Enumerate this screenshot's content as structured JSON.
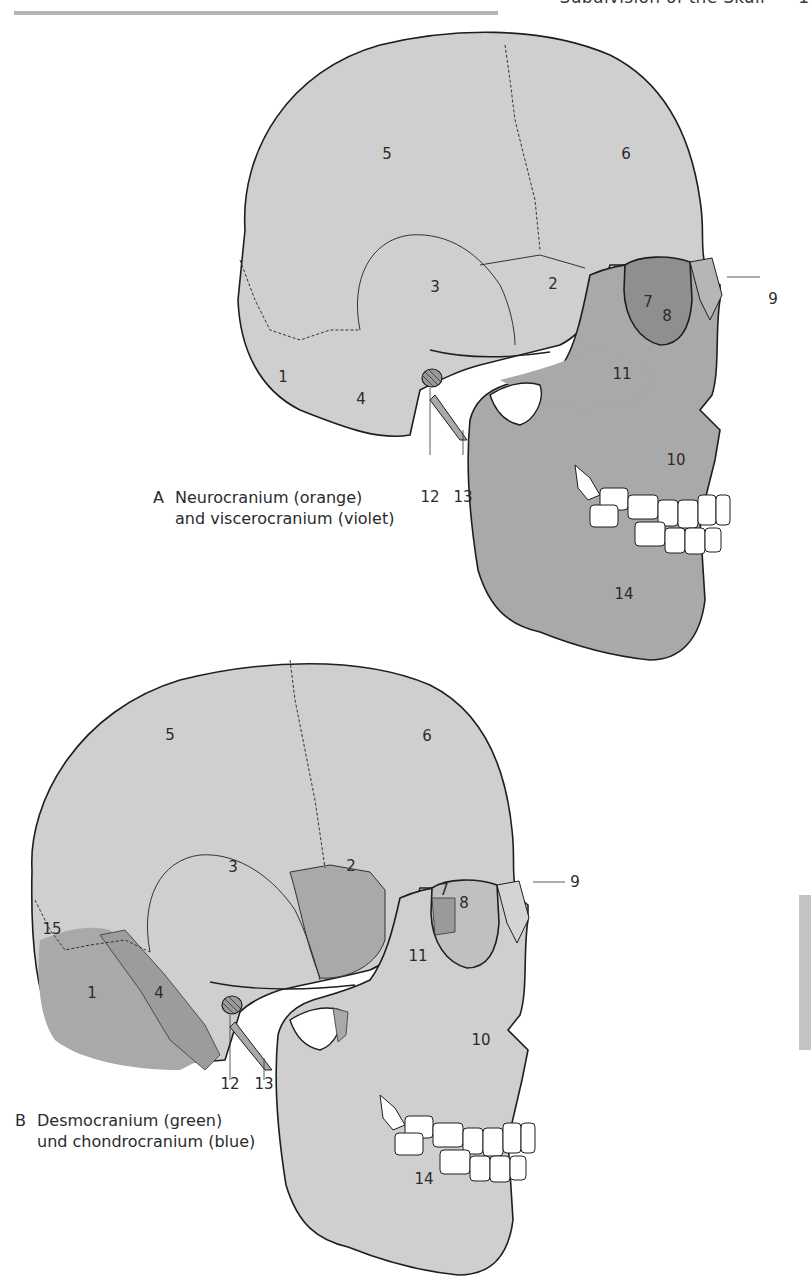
{
  "header": {
    "title": "Subdivision of the Skull",
    "page_number": "1"
  },
  "colors": {
    "light_bone": "#cfcfcf",
    "dark_bone": "#a9a9a9",
    "orbit_shadow": "#8f8f8f",
    "outline": "#1e1e1e",
    "teeth": "#ffffff",
    "header_rule": "#b4b4b4",
    "side_tab": "#c4c4c4"
  },
  "figures": [
    {
      "id": "A",
      "caption_letter": "A",
      "caption_line1": "Neurocranium (orange)",
      "caption_line2": "and viscerocranium (violet)",
      "labels": [
        "1",
        "2",
        "3",
        "4",
        "5",
        "6",
        "7",
        "8",
        "9",
        "10",
        "11",
        "12",
        "13",
        "14"
      ]
    },
    {
      "id": "B",
      "caption_letter": "B",
      "caption_line1": "Desmocranium (green)",
      "caption_line2": "und chondrocranium (blue)",
      "labels": [
        "1",
        "2",
        "3",
        "4",
        "5",
        "6",
        "7",
        "8",
        "9",
        "10",
        "11",
        "12",
        "13",
        "14",
        "15"
      ]
    }
  ]
}
